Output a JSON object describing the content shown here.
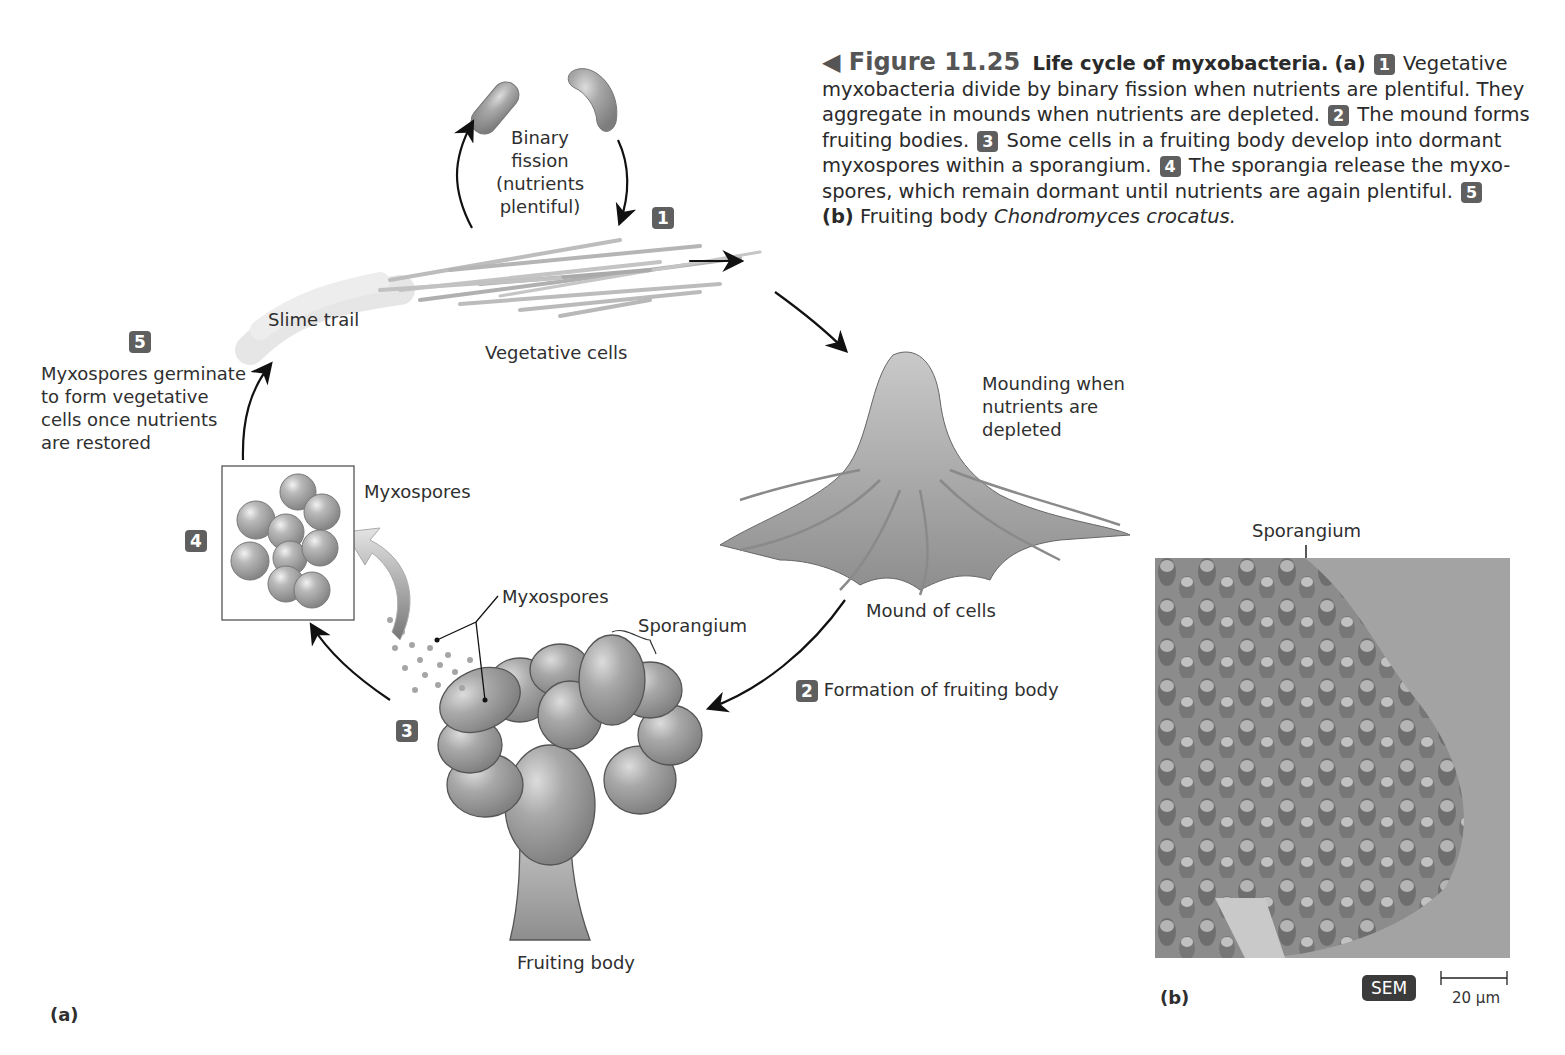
{
  "caption": {
    "figure_number": "◀ Figure 11.25",
    "title": "Life cycle of myxobacteria.",
    "part_a_marker": "(a)",
    "step1_badge": "1",
    "step1_text": " Vegetative myxobacteria divide by binary fission when nutrients are plentiful. They aggregate in mounds when nutrients are depleted. ",
    "step2_badge": "2",
    "step2_text": " The mound forms fruiting bodies. ",
    "step3_badge": "3",
    "step3_text": " Some cells in a fruiting body develop into dormant myxospores within a sporangium. ",
    "step4_badge": "4",
    "step4_text": " The sporangia release the myxo-spores, which remain dormant until nutrients are again plentiful. ",
    "step5_badge": "5",
    "part_b_marker": "(b)",
    "part_b_text": " Fruiting body ",
    "part_b_species": "Chondromyces crocatus."
  },
  "diagram": {
    "binary_fission": [
      "Binary",
      "fission",
      "(nutrients",
      "plentiful)"
    ],
    "step1_badge": "1",
    "slime_trail": "Slime trail",
    "vegetative_cells": "Vegetative cells",
    "step5_badge": "5",
    "step5_label": [
      "Myxospores germinate",
      "to form vegetative",
      "cells once nutrients",
      "are restored"
    ],
    "mounding_label": [
      "Mounding when",
      "nutrients are",
      "depleted"
    ],
    "mound_of_cells": "Mound of cells",
    "step4_badge": "4",
    "myxospores_box_label": "Myxospores",
    "myxospores_pointer_label": "Myxospores",
    "sporangium_label": "Sporangium",
    "step2_badge": "2",
    "step2_label": "Formation of fruiting body",
    "step3_badge": "3",
    "fruiting_body_label": "Fruiting body",
    "part_label": "(a)"
  },
  "micrograph": {
    "sporangium_label": "Sporangium",
    "part_label": "(b)",
    "technique_badge": "SEM",
    "scale_bar": "20 µm"
  }
}
